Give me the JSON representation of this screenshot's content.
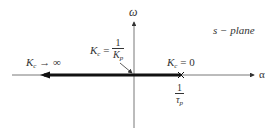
{
  "diagram": {
    "type": "root-locus",
    "plane_label": "s − plane",
    "axes": {
      "vertical_label": "ω",
      "horizontal_label": "α"
    },
    "annotations": {
      "kc_infinity": {
        "var": "K",
        "sub": "c",
        "rel": " → ∞"
      },
      "kc_crossing": {
        "var": "K",
        "sub": "c",
        "rel": " = ",
        "num": "1",
        "den_var": "K",
        "den_sub": "p"
      },
      "kc_zero": {
        "var": "K",
        "sub": "c",
        "rel": " = 0"
      },
      "pole_location": {
        "num": "1",
        "den_var": "τ",
        "den_sub": "p"
      }
    },
    "colors": {
      "axis": "#333333",
      "locus": "#111111",
      "background": "#ffffff"
    }
  }
}
